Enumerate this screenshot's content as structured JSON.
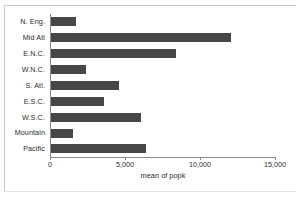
{
  "chart_data": {
    "type": "bar",
    "orientation": "horizontal",
    "title": "",
    "xlabel": "mean of popk",
    "ylabel": "",
    "categories": [
      "N. Eng.",
      "Mid Atl",
      "E.N.C.",
      "W.N.C.",
      "S. Atl.",
      "E.S.C.",
      "W.S.C.",
      "Mountain",
      "Pacific"
    ],
    "values": [
      1670,
      12000,
      8300,
      2330,
      4500,
      3550,
      6000,
      1450,
      6300
    ],
    "xlim": [
      0,
      15000
    ],
    "xticks": [
      0,
      5000,
      10000,
      15000
    ],
    "xtick_labels": [
      "0",
      "5,000",
      "10,000",
      "15,000"
    ],
    "grid": false,
    "legend": null,
    "bar_color": "#474747",
    "axis_color": "#8a8a8a",
    "background": "#ffffff"
  }
}
